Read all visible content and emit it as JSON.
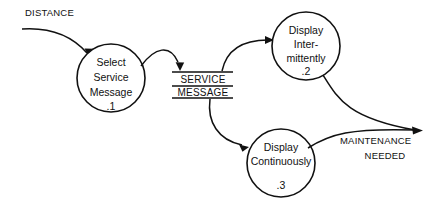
{
  "diagram": {
    "type": "data-flow-diagram",
    "background_color": "#ffffff",
    "stroke_color": "#111111",
    "processes": [
      {
        "id": "process-1",
        "number": ".1",
        "lines": [
          "Select",
          "Service",
          "Message"
        ],
        "line1": "Select",
        "line2": "Service",
        "line3": "Message",
        "cx": 111,
        "cy": 78,
        "r": 34
      },
      {
        "id": "process-2",
        "number": ".2",
        "lines": [
          "Display",
          "Inter-",
          "mittently"
        ],
        "line1": "Display",
        "line2": "Inter-",
        "line3": "mittently",
        "cx": 306,
        "cy": 46,
        "r": 34
      },
      {
        "id": "process-3",
        "number": ".3",
        "lines": [
          "Display",
          "Continuously"
        ],
        "line1": "Display",
        "line2": "Continuously",
        "cx": 281,
        "cy": 163,
        "r": 34
      }
    ],
    "data_stores": [
      {
        "id": "store-service-message",
        "line1": "SERVICE",
        "line2": "MESSAGE",
        "x_left": 172,
        "x_right": 233,
        "y_top": 72,
        "y_mid": 86,
        "y_bottom": 98
      }
    ],
    "flows": [
      {
        "id": "flow-distance",
        "label": "DISTANCE",
        "label_x": 25,
        "label_y": 13,
        "from": "external",
        "to": "process-1"
      },
      {
        "id": "flow-service-message-in",
        "label": "",
        "from": "process-1",
        "to": "store-service-message"
      },
      {
        "id": "flow-to-intermittent",
        "label": "",
        "from": "store-service-message",
        "to": "process-2"
      },
      {
        "id": "flow-to-continuous",
        "label": "",
        "from": "store-service-message",
        "to": "process-3"
      },
      {
        "id": "flow-maintenance-needed",
        "label_line1": "MAINTENANCE",
        "label_line2": "NEEDED",
        "label_x": 385,
        "label_y1": 141,
        "label_y2": 156,
        "from": "process-2, process-3",
        "to": "external"
      }
    ]
  }
}
